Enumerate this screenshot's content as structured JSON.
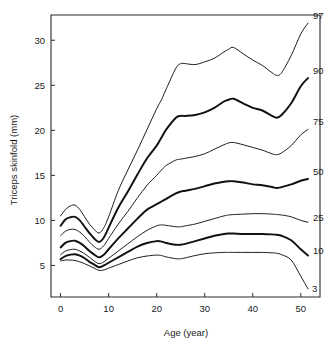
{
  "chart_data": {
    "type": "line",
    "title": "",
    "xlabel": "Age (year)",
    "ylabel": "Triceps skinfold (mm)",
    "xlim": [
      -2,
      54
    ],
    "ylim": [
      1.5,
      32.8
    ],
    "xticks": [
      0,
      10,
      20,
      30,
      40,
      50
    ],
    "xtick_labels": [
      "0",
      "10",
      "20",
      "30",
      "40",
      "50"
    ],
    "yticks": [
      5,
      10,
      15,
      20,
      25,
      30
    ],
    "ytick_labels": [
      "5",
      "10",
      "15",
      "20",
      "25",
      "30"
    ],
    "grid": false,
    "legend_position": "right-of-curve-ends",
    "legend_title": "percentile",
    "x": [
      0,
      1,
      2,
      3,
      4,
      5,
      6,
      7,
      8,
      9,
      10,
      12,
      14,
      16,
      18,
      20,
      21,
      22,
      24,
      25,
      26,
      28,
      30,
      32,
      34,
      35,
      36,
      38,
      40,
      42,
      44,
      45,
      46,
      48,
      50,
      51.5
    ],
    "series": [
      {
        "name": "97",
        "label": "97",
        "weight": "thin",
        "values": [
          10.5,
          11.2,
          11.6,
          11.7,
          11.2,
          10.4,
          9.6,
          9.0,
          8.6,
          9.2,
          10.4,
          13.3,
          15.6,
          17.8,
          20.1,
          22.4,
          23.4,
          24.6,
          26.9,
          27.4,
          27.4,
          27.3,
          27.6,
          28.0,
          28.7,
          29.0,
          29.2,
          28.5,
          27.8,
          27.2,
          26.4,
          26.1,
          26.4,
          28.3,
          30.7,
          31.9
        ]
      },
      {
        "name": "90",
        "label": "90",
        "weight": "bold",
        "values": [
          9.4,
          10.1,
          10.35,
          10.4,
          10.0,
          9.3,
          8.6,
          8.0,
          7.6,
          8.1,
          9.2,
          11.4,
          13.2,
          15.1,
          16.9,
          18.3,
          19.2,
          20.1,
          21.4,
          21.6,
          21.6,
          21.7,
          22.0,
          22.5,
          23.2,
          23.4,
          23.5,
          23.0,
          22.5,
          22.2,
          21.6,
          21.4,
          21.7,
          23.0,
          24.9,
          25.8
        ]
      },
      {
        "name": "75",
        "label": "75",
        "weight": "thin",
        "values": [
          8.3,
          8.8,
          9.0,
          9.0,
          8.7,
          8.2,
          7.6,
          7.1,
          6.8,
          7.2,
          8.0,
          9.6,
          11.0,
          12.5,
          13.9,
          15.0,
          15.6,
          16.1,
          16.7,
          16.8,
          16.9,
          17.1,
          17.4,
          17.9,
          18.4,
          18.6,
          18.65,
          18.4,
          18.1,
          17.8,
          17.4,
          17.3,
          17.5,
          18.3,
          19.5,
          20.1
        ]
      },
      {
        "name": "50",
        "label": "50",
        "weight": "bold",
        "values": [
          7.0,
          7.5,
          7.7,
          7.75,
          7.5,
          7.1,
          6.6,
          6.2,
          5.9,
          6.2,
          6.8,
          8.0,
          9.1,
          10.2,
          11.2,
          11.8,
          12.1,
          12.4,
          13.0,
          13.2,
          13.3,
          13.5,
          13.8,
          14.1,
          14.3,
          14.35,
          14.35,
          14.2,
          14.0,
          13.9,
          13.7,
          13.6,
          13.7,
          14.0,
          14.4,
          14.6
        ]
      },
      {
        "name": "25",
        "label": "25",
        "weight": "thin",
        "values": [
          6.2,
          6.6,
          6.75,
          6.8,
          6.6,
          6.3,
          5.9,
          5.5,
          5.2,
          5.4,
          5.8,
          6.6,
          7.4,
          8.2,
          8.9,
          9.4,
          9.5,
          9.45,
          9.3,
          9.3,
          9.4,
          9.6,
          9.9,
          10.2,
          10.5,
          10.6,
          10.65,
          10.7,
          10.75,
          10.75,
          10.7,
          10.65,
          10.6,
          10.4,
          10.0,
          9.8
        ]
      },
      {
        "name": "10",
        "label": "10",
        "weight": "bold",
        "values": [
          5.7,
          6.05,
          6.2,
          6.25,
          6.1,
          5.8,
          5.4,
          5.1,
          4.8,
          5.0,
          5.3,
          5.9,
          6.5,
          7.1,
          7.5,
          7.7,
          7.65,
          7.5,
          7.3,
          7.3,
          7.4,
          7.7,
          8.0,
          8.3,
          8.5,
          8.55,
          8.55,
          8.5,
          8.5,
          8.5,
          8.45,
          8.4,
          8.3,
          7.8,
          6.8,
          6.1
        ]
      },
      {
        "name": "3",
        "label": "3",
        "weight": "thin",
        "values": [
          5.5,
          5.6,
          5.6,
          5.55,
          5.4,
          5.2,
          4.95,
          4.7,
          4.45,
          4.5,
          4.7,
          5.1,
          5.5,
          5.85,
          6.05,
          6.15,
          6.1,
          5.95,
          5.75,
          5.75,
          5.85,
          6.1,
          6.3,
          6.4,
          6.45,
          6.45,
          6.45,
          6.45,
          6.45,
          6.45,
          6.4,
          6.35,
          6.2,
          5.6,
          3.8,
          2.4
        ]
      }
    ]
  }
}
